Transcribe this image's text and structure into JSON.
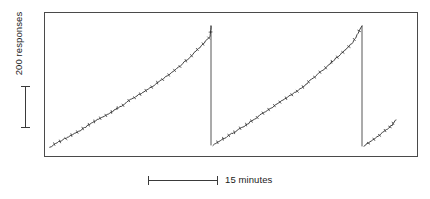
{
  "figure": {
    "kind": "cumulative-record",
    "background_color": "#ffffff",
    "ink_color": "#2b2b2b",
    "frame_color": "#4a4a4a"
  },
  "y_axis": {
    "scale_label": "200 responses",
    "scale_bar_responses": 200,
    "orientation": "vertical"
  },
  "x_axis": {
    "scale_label": "15 minutes",
    "scale_bar_minutes": 15,
    "orientation": "horizontal"
  },
  "chart_data": {
    "type": "line",
    "title": "",
    "subtitle": "",
    "xlabel": "15 minutes",
    "ylabel": "200 responses",
    "grid": false,
    "legend": null,
    "annotations": [],
    "axis_note": "Unlabeled axes; calibration given by scale bars only. 200 responses = 42 px vertical; 15 minutes = 70 px horizontal.",
    "xlim": [
      0,
      374
    ],
    "ylim": [
      0,
      145
    ],
    "y_direction": "up",
    "series": [
      {
        "name": "cumulative-segment-1",
        "stroke": "#2b2b2b",
        "x": [
          6,
          16,
          26,
          36,
          46,
          56,
          66,
          76,
          86,
          96,
          106,
          116,
          126,
          136,
          146,
          156,
          166,
          167
        ],
        "y": [
          135,
          129,
          124,
          119,
          112,
          106,
          101,
          95,
          88,
          82,
          76,
          69,
          62,
          54,
          45,
          35,
          25,
          14
        ]
      },
      {
        "name": "pen-reset-1",
        "stroke": "#2b2b2b",
        "x": [
          167,
          167
        ],
        "y": [
          14,
          133
        ]
      },
      {
        "name": "cumulative-segment-2",
        "stroke": "#2b2b2b",
        "x": [
          169,
          179,
          189,
          199,
          209,
          219,
          229,
          239,
          249,
          259,
          269,
          279,
          289,
          299,
          309,
          318
        ],
        "y": [
          133,
          127,
          121,
          115,
          108,
          101,
          95,
          88,
          82,
          75,
          66,
          58,
          49,
          40,
          30,
          14
        ]
      },
      {
        "name": "pen-reset-2",
        "stroke": "#2b2b2b",
        "x": [
          318,
          318
        ],
        "y": [
          14,
          134
        ]
      },
      {
        "name": "cumulative-segment-3",
        "stroke": "#2b2b2b",
        "x": [
          320,
          330,
          340,
          348,
          352
        ],
        "y": [
          134,
          127,
          120,
          113,
          108
        ]
      }
    ],
    "reset_count": 2,
    "segment_count": 3,
    "event_marks": "small oblique hatch marks along each ramp indicate reinforcement deliveries"
  }
}
